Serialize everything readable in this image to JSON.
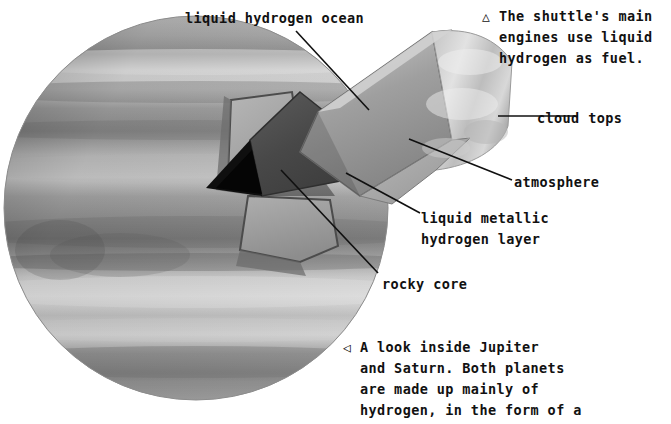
{
  "figure": {
    "kind": "cutaway-illustration",
    "background_color": "#ffffff",
    "text_color": "#111111"
  },
  "planet": {
    "name": "gas-giant-planet",
    "center_x": 196,
    "center_y": 208,
    "radius": 192,
    "band_colors": [
      "#b9b9b9",
      "#8f8f8f",
      "#cfcfcf",
      "#a2a2a2",
      "#d5d5d5",
      "#9a9a9a",
      "#c4c4c4",
      "#7e7e7e",
      "#bdbdbd",
      "#a8a8a8",
      "#d8d8d8",
      "#8a8a8a",
      "#b2b2b2",
      "#6f6f6f",
      "#a5a5a5"
    ]
  },
  "layers": {
    "cloud_tops_color": "#d9d9d9",
    "atmosphere_color": "#9e9e9e",
    "liquid_hydrogen_ocean_color": "#b0b0b0",
    "liquid_metallic_hydrogen_color": "#4a4a4a",
    "rocky_core_color": "#121212"
  },
  "labels": [
    {
      "id": "liquid-hydrogen-ocean",
      "text": "liquid hydrogen ocean",
      "x": 185,
      "y": 8
    },
    {
      "id": "cloud-tops",
      "text": "cloud tops",
      "x": 537,
      "y": 108
    },
    {
      "id": "atmosphere",
      "text": "atmosphere",
      "x": 514,
      "y": 172
    },
    {
      "id": "liquid-metallic-hydrogen-layer",
      "text": "liquid metallic\nhydrogen layer",
      "x": 421,
      "y": 208
    },
    {
      "id": "rocky-core",
      "text": "rocky core",
      "x": 382,
      "y": 274
    }
  ],
  "callouts": {
    "top_right": {
      "marker": "△",
      "marker_name": "triangle-up-marker",
      "text": "The shuttle's main\nengines use liquid\nhydrogen as fuel.",
      "x": 499,
      "y": 6
    },
    "bottom_right": {
      "marker": "◁",
      "marker_name": "triangle-left-marker",
      "text": "A look inside Jupiter\nand Saturn. Both planets\nare made up mainly of\nhydrogen, in the form of a\nliquid and a liquid metal.",
      "x": 360,
      "y": 337
    }
  },
  "leader_lines": [
    {
      "id": "leader-liquid-hydrogen-ocean",
      "x1": 296,
      "y1": 31,
      "x2": 369,
      "y2": 110
    },
    {
      "id": "leader-cloud-tops",
      "x1": 498,
      "y1": 116,
      "x2": 578,
      "y2": 116
    },
    {
      "id": "leader-atmosphere",
      "x1": 409,
      "y1": 139,
      "x2": 512,
      "y2": 180
    },
    {
      "id": "leader-liquid-metallic",
      "x1": 346,
      "y1": 173,
      "x2": 420,
      "y2": 213
    },
    {
      "id": "leader-rocky-core",
      "x1": 281,
      "y1": 170,
      "x2": 378,
      "y2": 273
    }
  ]
}
